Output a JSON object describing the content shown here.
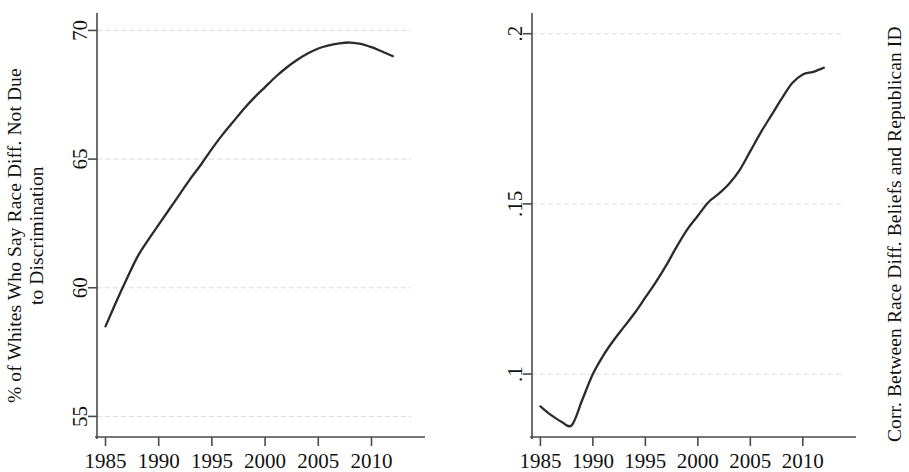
{
  "figure": {
    "background_color": "#ffffff",
    "line_color": "#2b2b2b",
    "grid_color": "#dcdcdc",
    "axis_color": "#4a4a4a"
  },
  "panels": {
    "left": {
      "ylabel": "% of Whites Who Say Race Diff. Not Due\nto Discrimination",
      "xlabel": "",
      "yticks": [
        "55",
        "60",
        "65",
        "70"
      ],
      "xticks": [
        "1985",
        "1990",
        "1995",
        "2000",
        "2005",
        "2010"
      ]
    },
    "right": {
      "ylabel": "Corr. Between Race Diff. Beliefs and Republican ID",
      "xlabel": "",
      "yticks": [
        ".1",
        ".15",
        ".2"
      ],
      "xticks": [
        "1985",
        "1990",
        "1995",
        "2000",
        "2005",
        "2010"
      ]
    }
  },
  "chart_data": [
    {
      "type": "line",
      "title": "",
      "xlabel": "",
      "ylabel": "% of Whites Who Say Race Diff. Not Due to Discrimination",
      "xlim": [
        1984.2,
        2012.4
      ],
      "ylim": [
        54.2,
        70.6
      ],
      "xticks": [
        1985,
        1990,
        1995,
        2000,
        2005,
        2010
      ],
      "xticklabels": [
        "1985",
        "1990",
        "1995",
        "2000",
        "2005",
        "2010"
      ],
      "yticks": [
        55,
        60,
        65,
        70
      ],
      "yticklabels": [
        "55",
        "60",
        "65",
        "70"
      ],
      "grid": true,
      "grid_axis": "y",
      "legend": null,
      "series": [
        {
          "name": "% Whites: race diff not due to discrimination",
          "x": [
            1985,
            1986,
            1987,
            1988,
            1989,
            1990,
            1991,
            1992,
            1993,
            1994,
            1995,
            1996,
            1997,
            1998,
            1999,
            2000,
            2001,
            2002,
            2003,
            2004,
            2005,
            2006,
            2007,
            2008,
            2009,
            2010,
            2011,
            2012
          ],
          "values": [
            58.5,
            59.45,
            60.35,
            61.2,
            61.85,
            62.45,
            63.05,
            63.65,
            64.25,
            64.8,
            65.4,
            65.95,
            66.45,
            66.95,
            67.4,
            67.8,
            68.2,
            68.55,
            68.85,
            69.1,
            69.3,
            69.42,
            69.5,
            69.53,
            69.48,
            69.35,
            69.18,
            69.0
          ]
        }
      ]
    },
    {
      "type": "line",
      "title": "",
      "xlabel": "",
      "ylabel": "Corr. Between Race Diff. Beliefs and Republican ID",
      "xlim": [
        1984.2,
        2012.4
      ],
      "ylim": [
        0.0815,
        0.2055
      ],
      "xticks": [
        1985,
        1990,
        1995,
        2000,
        2005,
        2010
      ],
      "xticklabels": [
        "1985",
        "1990",
        "1995",
        "2000",
        "2005",
        "2010"
      ],
      "yticks": [
        0.1,
        0.15,
        0.2
      ],
      "yticklabels": [
        ".1",
        ".15",
        ".2"
      ],
      "grid": true,
      "grid_axis": "y",
      "legend": null,
      "series": [
        {
          "name": "Corr. race diff beliefs & Republican ID",
          "x": [
            1985,
            1986,
            1987,
            1988,
            1989,
            1990,
            1991,
            1992,
            1993,
            1994,
            1995,
            1996,
            1997,
            1998,
            1999,
            2000,
            2001,
            2002,
            2003,
            2004,
            2005,
            2006,
            2007,
            2008,
            2009,
            2010,
            2011,
            2012
          ],
          "values": [
            0.0905,
            0.088,
            0.086,
            0.085,
            0.0925,
            0.1,
            0.1055,
            0.11,
            0.114,
            0.118,
            0.1225,
            0.127,
            0.132,
            0.1375,
            0.1425,
            0.1465,
            0.1505,
            0.153,
            0.156,
            0.16,
            0.1655,
            0.171,
            0.176,
            0.181,
            0.1855,
            0.188,
            0.1888,
            0.19
          ]
        }
      ]
    }
  ]
}
